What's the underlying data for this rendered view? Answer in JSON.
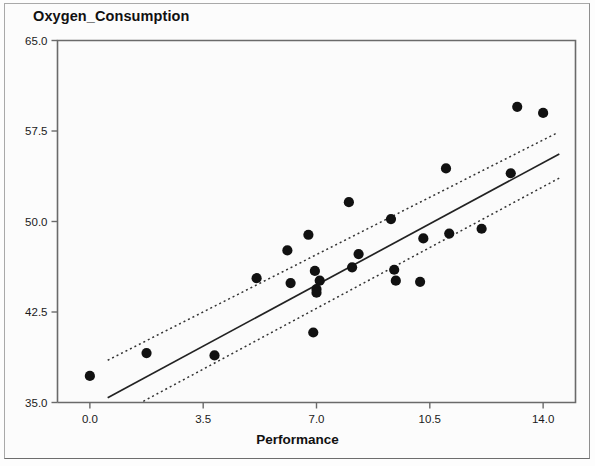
{
  "chart_data": {
    "type": "scatter",
    "title": "Oxygen_Consumption",
    "xlabel": "Performance",
    "ylabel": "Oxygen_Consumption",
    "xlim": [
      -1.0,
      15.0
    ],
    "ylim": [
      35.0,
      65.0
    ],
    "xticks": [
      "0.0",
      "3.5",
      "7.0",
      "10.5",
      "14.0"
    ],
    "xtick_values": [
      0.0,
      3.5,
      7.0,
      10.5,
      14.0
    ],
    "yticks": [
      "35.0",
      "42.5",
      "50.0",
      "57.5",
      "65.0"
    ],
    "ytick_values": [
      35.0,
      42.5,
      50.0,
      57.5,
      65.0
    ],
    "grid": false,
    "legend": "none",
    "marker_color": "#111111",
    "line_color": "#222222",
    "band_color": "#333333",
    "plot_background": "#fbfbfb",
    "frame_color": "#6a6a6a",
    "points": [
      {
        "x": 0.0,
        "y": 37.2
      },
      {
        "x": 1.75,
        "y": 39.1
      },
      {
        "x": 3.85,
        "y": 38.9
      },
      {
        "x": 5.15,
        "y": 45.3
      },
      {
        "x": 6.1,
        "y": 47.6
      },
      {
        "x": 6.2,
        "y": 44.9
      },
      {
        "x": 6.75,
        "y": 48.9
      },
      {
        "x": 6.9,
        "y": 40.8
      },
      {
        "x": 6.95,
        "y": 45.9
      },
      {
        "x": 7.0,
        "y": 44.4
      },
      {
        "x": 7.0,
        "y": 44.1
      },
      {
        "x": 7.1,
        "y": 45.1
      },
      {
        "x": 8.0,
        "y": 51.6
      },
      {
        "x": 8.1,
        "y": 46.2
      },
      {
        "x": 8.3,
        "y": 47.3
      },
      {
        "x": 9.3,
        "y": 50.2
      },
      {
        "x": 9.4,
        "y": 46.0
      },
      {
        "x": 9.45,
        "y": 45.1
      },
      {
        "x": 10.2,
        "y": 45.0
      },
      {
        "x": 10.3,
        "y": 48.6
      },
      {
        "x": 11.0,
        "y": 54.4
      },
      {
        "x": 11.1,
        "y": 49.0
      },
      {
        "x": 12.1,
        "y": 49.4
      },
      {
        "x": 13.0,
        "y": 54.0
      },
      {
        "x": 13.2,
        "y": 59.5
      },
      {
        "x": 14.0,
        "y": 59.0
      }
    ],
    "regression_line": {
      "style": "solid",
      "x_start": 0.55,
      "y_start": 35.4,
      "x_end": 14.5,
      "y_end": 55.6
    },
    "confidence_band_upper": {
      "style": "dotted",
      "x_start": 0.55,
      "y_start": 38.5,
      "x_end": 14.4,
      "y_end": 57.3
    },
    "confidence_band_lower": {
      "style": "dotted",
      "x_start": 1.65,
      "y_start": 35.1,
      "x_end": 14.5,
      "y_end": 53.6
    }
  }
}
